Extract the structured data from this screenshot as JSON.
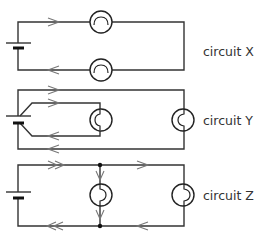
{
  "diagram": {
    "type": "circuit-diagrams",
    "circuits": [
      {
        "id": "X",
        "label": "circuit X",
        "arrangement": "two bulbs in series",
        "arrow_style": "single"
      },
      {
        "id": "Y",
        "label": "circuit Y",
        "arrangement": "two bulbs each connected directly across the cell (separate loops)",
        "arrow_style": "single"
      },
      {
        "id": "Z",
        "label": "circuit Z",
        "arrangement": "two bulbs in parallel with junctions",
        "arrow_style": "double in main line, single in branches"
      }
    ],
    "colors": {
      "wire": "#333333",
      "arrow": "#777777",
      "text": "#333333"
    }
  }
}
